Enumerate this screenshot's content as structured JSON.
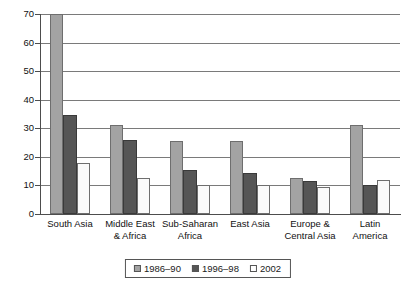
{
  "chart_data": {
    "type": "bar",
    "title": "",
    "subtitle": "",
    "xlabel": "",
    "ylabel": "",
    "ylim": [
      0,
      70
    ],
    "yticks": [
      0,
      10,
      20,
      30,
      40,
      50,
      60,
      70
    ],
    "ytick_labels": [
      "0",
      "10",
      "20",
      "30",
      "40",
      "50",
      "60",
      "70"
    ],
    "grid": true,
    "grid_axis": "y",
    "legend_position": "bottom-center",
    "categories": [
      "South Asia",
      "Middle East\n& Africa",
      "Sub-Saharan\nAfrica",
      "East Asia",
      "Europe &\nCentral Asia",
      "Latin\nAmerica"
    ],
    "category_lines": [
      [
        "South Asia"
      ],
      [
        "Middle East",
        "& Africa"
      ],
      [
        "Sub-Saharan",
        "Africa"
      ],
      [
        "East Asia"
      ],
      [
        "Europe &",
        "Central Asia"
      ],
      [
        "Latin",
        "America"
      ]
    ],
    "series": [
      {
        "name": "1986–90",
        "color": "#a3a3a3",
        "values": [
          70,
          31,
          25.5,
          25.5,
          12.5,
          31
        ]
      },
      {
        "name": "1996–98",
        "color": "#565656",
        "values": [
          34.5,
          26,
          15.5,
          14.5,
          11.5,
          10
        ]
      },
      {
        "name": "2002",
        "color": "#ffffff",
        "values": [
          18,
          12.5,
          10,
          10,
          9.5,
          12
        ]
      }
    ]
  },
  "legend": {
    "entries": [
      {
        "label": "1986–90",
        "swatch": "light-gray-swatch"
      },
      {
        "label": "1996–98",
        "swatch": "dark-gray-swatch"
      },
      {
        "label": "2002",
        "swatch": "white-swatch"
      }
    ]
  },
  "colors": {
    "series_1986_90": "#a3a3a3",
    "series_1996_98": "#565656",
    "series_2002": "#ffffff",
    "axis": "#4d4d4d",
    "gridline": "#7a7a7a",
    "text": "#111111",
    "background": "#ffffff"
  }
}
